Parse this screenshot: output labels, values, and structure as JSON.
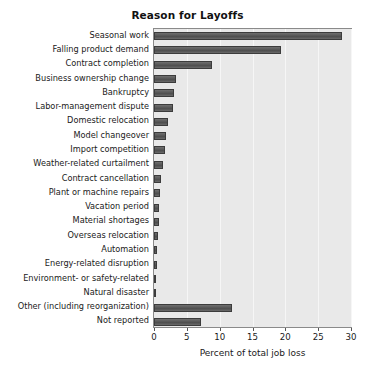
{
  "chart_data": {
    "type": "bar",
    "orientation": "horizontal",
    "title": "Reason for Layoffs",
    "xlabel": "Percent of total job loss",
    "ylabel": "",
    "xlim": [
      0,
      30
    ],
    "xticks": [
      0,
      5,
      10,
      15,
      20,
      25,
      30
    ],
    "grid": true,
    "legend": null,
    "categories": [
      "Seasonal work",
      "Falling product demand",
      "Contract completion",
      "Business ownership change",
      "Bankruptcy",
      "Labor-management dispute",
      "Domestic relocation",
      "Model changeover",
      "Import competition",
      "Weather-related curtailment",
      "Contract cancellation",
      "Plant or machine repairs",
      "Vacation period",
      "Material shortages",
      "Overseas relocation",
      "Automation",
      "Energy-related disruption",
      "Environment- or safety-related",
      "Natural disaster",
      "Other (including reorganization)",
      "Not reported"
    ],
    "values": [
      28.6,
      19.3,
      8.8,
      3.3,
      3.1,
      2.9,
      2.2,
      1.9,
      1.7,
      1.3,
      1.1,
      0.9,
      0.8,
      0.7,
      0.6,
      0.5,
      0.4,
      0.3,
      0.2,
      11.9,
      7.1
    ],
    "colors": {
      "bar": "#555555",
      "bar_edge": "#3c3c3c",
      "plot_background": "#e9e9e9",
      "figure_background": "#ffffff",
      "gridline": "#f6f6f6",
      "axis": "#8a8a8a",
      "text": "#1a1a1a"
    }
  }
}
